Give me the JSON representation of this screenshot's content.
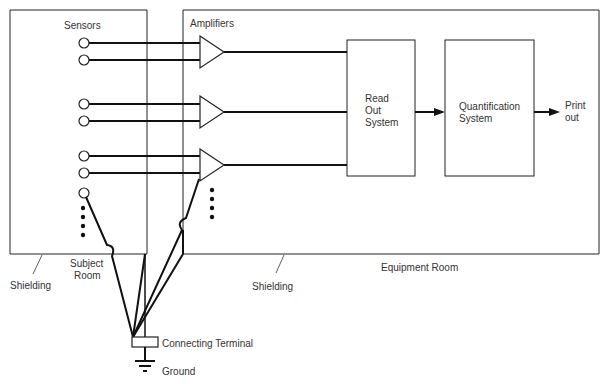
{
  "diagram": {
    "type": "block-schematic",
    "rooms": {
      "subject_room": "Subject Room",
      "equipment_room": "Equipment Room"
    },
    "labels": {
      "sensors": "Sensors",
      "amplifiers": "Amplifiers",
      "readout_line1": "Read",
      "readout_line2": "Out",
      "readout_line3": "System",
      "quant_line1": "Quantification",
      "quant_line2": "System",
      "print_line1": "Print",
      "print_line2": "out",
      "shielding_left": "Shielding",
      "shielding_right": "Shielding",
      "subject_line1": "Subject",
      "subject_line2": "Room",
      "equipment_room": "Equipment Room",
      "connecting_terminal": "Connecting Terminal",
      "ground": "Ground"
    },
    "nodes": [
      {
        "id": "sensors",
        "label": "Sensors",
        "count_visible": 7,
        "continuation": "dots"
      },
      {
        "id": "amplifiers",
        "label": "Amplifiers",
        "count_visible": 3,
        "continuation": "dots"
      },
      {
        "id": "readout",
        "label": "Read Out System"
      },
      {
        "id": "quantification",
        "label": "Quantification System"
      },
      {
        "id": "printout",
        "label": "Print out"
      },
      {
        "id": "terminal",
        "label": "Connecting Terminal"
      },
      {
        "id": "ground",
        "label": "Ground"
      }
    ],
    "edges": [
      {
        "from": "sensors",
        "to": "amplifiers",
        "note": "paired sensor leads into each amplifier"
      },
      {
        "from": "amplifiers",
        "to": "readout"
      },
      {
        "from": "readout",
        "to": "quantification",
        "arrow": true
      },
      {
        "from": "quantification",
        "to": "printout",
        "arrow": true
      },
      {
        "from": "sensors",
        "to": "terminal",
        "note": "common lead"
      },
      {
        "from": "amplifiers",
        "to": "terminal",
        "note": "common lead"
      },
      {
        "from": "subject_room_shielding",
        "to": "terminal"
      },
      {
        "from": "equipment_room_shielding",
        "to": "terminal"
      },
      {
        "from": "terminal",
        "to": "ground"
      }
    ]
  }
}
